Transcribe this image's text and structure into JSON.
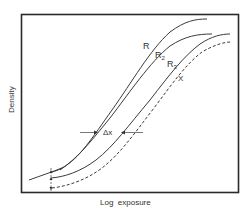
{
  "diagram": {
    "type": "characteristic-curves",
    "x_axis_label": "Log  exposure",
    "y_axis_label": "Density",
    "curves": [
      {
        "id": "R",
        "label": "R",
        "subscript": "",
        "style": "solid"
      },
      {
        "id": "R2",
        "label": "R",
        "subscript": "2",
        "style": "solid"
      },
      {
        "id": "R3",
        "label": "R",
        "subscript": "3",
        "style": "solid"
      },
      {
        "id": "X",
        "label": "X",
        "subscript": "",
        "style": "dashed"
      }
    ],
    "annotations": {
      "shift_label": "Δx",
      "vertical_offset_marker": "fog-offset-arrows"
    },
    "colors": {
      "line": "#3a3a3a",
      "frame": "#2a2a2a",
      "background": "#ffffff"
    }
  }
}
